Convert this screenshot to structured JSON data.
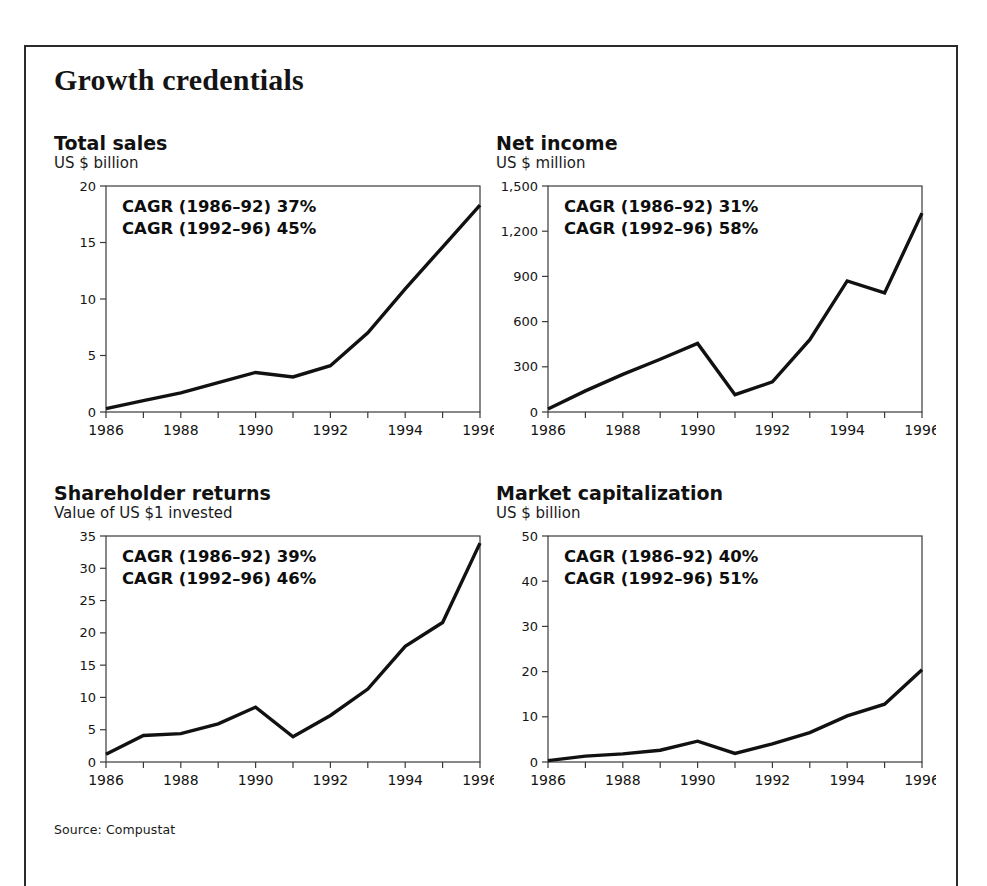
{
  "exhibit": {
    "title": "Growth credentials",
    "source": "Source: Compustat"
  },
  "chart_data": [
    {
      "id": "total-sales",
      "type": "line",
      "title": "Total sales",
      "subtitle": "US $ billion",
      "xlabel": "",
      "ylabel": "US $ billion",
      "x": [
        1986,
        1987,
        1988,
        1989,
        1990,
        1991,
        1992,
        1993,
        1994,
        1995,
        1996
      ],
      "values": [
        0.3,
        1.0,
        1.7,
        2.6,
        3.5,
        3.1,
        4.1,
        7.0,
        10.9,
        14.6,
        18.3
      ],
      "ylim": [
        0,
        20
      ],
      "yticks": [
        0,
        5,
        10,
        15,
        20
      ],
      "ytick_labels": [
        "0",
        "5",
        "10",
        "15",
        "20"
      ],
      "xlim": [
        1986,
        1996
      ],
      "xticks": [
        1986,
        1988,
        1990,
        1992,
        1994,
        1996
      ],
      "xtick_labels": [
        "1986",
        "1988",
        "1990",
        "1992",
        "1994",
        "1996"
      ],
      "grid": false,
      "annotations": [
        "CAGR (1986–92) 37%",
        "CAGR (1992–96) 45%"
      ]
    },
    {
      "id": "net-income",
      "type": "line",
      "title": "Net income",
      "subtitle": "US $ million",
      "xlabel": "",
      "ylabel": "US $ million",
      "x": [
        1986,
        1987,
        1988,
        1989,
        1990,
        1991,
        1992,
        1993,
        1994,
        1995,
        1996
      ],
      "values": [
        20,
        140,
        250,
        350,
        455,
        115,
        200,
        480,
        870,
        790,
        1320
      ],
      "ylim": [
        0,
        1500
      ],
      "yticks": [
        0,
        300,
        600,
        900,
        1200,
        1500
      ],
      "ytick_labels": [
        "0",
        "300",
        "600",
        "900",
        "1,200",
        "1,500"
      ],
      "xlim": [
        1986,
        1996
      ],
      "xticks": [
        1986,
        1988,
        1990,
        1992,
        1994,
        1996
      ],
      "xtick_labels": [
        "1986",
        "1988",
        "1990",
        "1992",
        "1994",
        "1996"
      ],
      "grid": false,
      "annotations": [
        "CAGR (1986–92) 31%",
        "CAGR (1992–96) 58%"
      ]
    },
    {
      "id": "shareholder-returns",
      "type": "line",
      "title": "Shareholder returns",
      "subtitle": "Value of US $1 invested",
      "xlabel": "",
      "ylabel": "Value of US $1 invested",
      "x": [
        1986,
        1987,
        1988,
        1989,
        1990,
        1991,
        1992,
        1993,
        1994,
        1995,
        1996
      ],
      "values": [
        1.2,
        4.1,
        4.4,
        5.9,
        8.5,
        3.9,
        7.2,
        11.3,
        17.9,
        21.6,
        33.9
      ],
      "ylim": [
        0,
        35
      ],
      "yticks": [
        0,
        5,
        10,
        15,
        20,
        25,
        30,
        35
      ],
      "ytick_labels": [
        "0",
        "5",
        "10",
        "15",
        "20",
        "25",
        "30",
        "35"
      ],
      "xlim": [
        1986,
        1996
      ],
      "xticks": [
        1986,
        1988,
        1990,
        1992,
        1994,
        1996
      ],
      "xtick_labels": [
        "1986",
        "1988",
        "1990",
        "1992",
        "1994",
        "1996"
      ],
      "grid": false,
      "annotations": [
        "CAGR (1986–92) 39%",
        "CAGR (1992–96) 46%"
      ]
    },
    {
      "id": "market-capitalization",
      "type": "line",
      "title": "Market capitalization",
      "subtitle": "US $ billion",
      "xlabel": "",
      "ylabel": "US $ billion",
      "x": [
        1986,
        1987,
        1988,
        1989,
        1990,
        1991,
        1992,
        1993,
        1994,
        1995,
        1996
      ],
      "values": [
        0.3,
        1.3,
        1.8,
        2.6,
        4.6,
        1.9,
        4.0,
        6.5,
        10.2,
        12.8,
        20.4
      ],
      "ylim": [
        0,
        50
      ],
      "yticks": [
        0,
        10,
        20,
        30,
        40,
        50
      ],
      "ytick_labels": [
        "0",
        "10",
        "20",
        "30",
        "40",
        "50"
      ],
      "xlim": [
        1986,
        1996
      ],
      "xticks": [
        1986,
        1988,
        1990,
        1992,
        1994,
        1996
      ],
      "xtick_labels": [
        "1986",
        "1988",
        "1990",
        "1992",
        "1994",
        "1996"
      ],
      "grid": false,
      "annotations": [
        "CAGR (1986–92) 40%",
        "CAGR (1992–96) 51%"
      ]
    }
  ],
  "style": {
    "line_color": "#111111",
    "axis_color": "#3a3a3a",
    "text_color": "#141414",
    "background": "#ffffff"
  }
}
